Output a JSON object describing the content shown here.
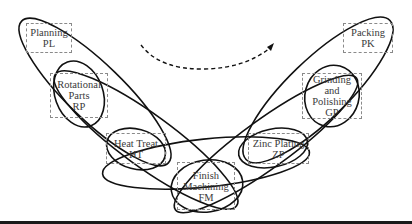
{
  "diagram": {
    "type": "process-flow-overlapping-ellipses",
    "nodes": [
      {
        "id": "PL",
        "line1": "Planning",
        "line2": "PL",
        "line3": ""
      },
      {
        "id": "RP",
        "line1": "Rotational",
        "line2": "Parts",
        "line3": "RP"
      },
      {
        "id": "HT",
        "line1": "Heat Treat",
        "line2": "HT",
        "line3": ""
      },
      {
        "id": "FM",
        "line1": "Finish",
        "line2": "Machining",
        "line3": "FM"
      },
      {
        "id": "ZP",
        "line1": "Zinc Plating",
        "line2": "ZP",
        "line3": ""
      },
      {
        "id": "GP",
        "line1": "Grinding",
        "line2": "and",
        "line3": "Polishing",
        "line4": "GP"
      },
      {
        "id": "PK",
        "line1": "Packing",
        "line2": "PK",
        "line3": ""
      }
    ],
    "flow_arrow": {
      "style": "dashed",
      "direction": "left-to-right"
    },
    "colors": {
      "stroke": "#111111",
      "node_border": "#8a8a8a",
      "text": "#3a3a3a",
      "background": "#ffffff"
    }
  }
}
